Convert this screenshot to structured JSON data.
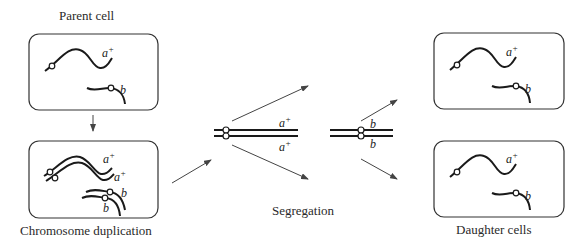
{
  "labels": {
    "parent": "Parent cell",
    "duplication": "Chromosome duplication",
    "segregation": "Segregation",
    "daughters": "Daughter cells"
  },
  "genes": {
    "a": "a",
    "a_sup": "+",
    "b": "b"
  },
  "colors": {
    "stroke": "#1a1a1a",
    "box": "#333333",
    "arrow": "#444444"
  }
}
